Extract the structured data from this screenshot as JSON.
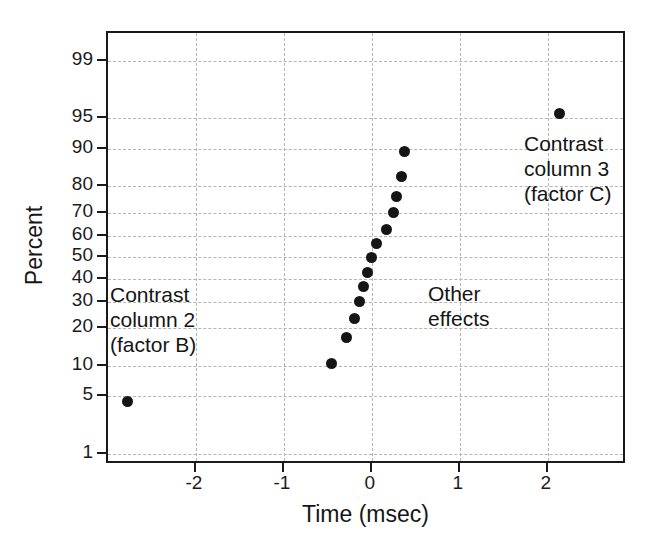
{
  "chart_data": {
    "type": "scatter",
    "title": "",
    "xlabel": "Time (msec)",
    "ylabel": "Percent",
    "xlim": [
      -3.0,
      2.9
    ],
    "ylim_percent": [
      0.7,
      99.6
    ],
    "grid": true,
    "legend": "none",
    "x_ticks": [
      "-2",
      "-1",
      "0",
      "1",
      "2"
    ],
    "x_tick_values": [
      -2,
      -1,
      0,
      1,
      2
    ],
    "y_ticks": [
      "99",
      "95",
      "90",
      "80",
      "70",
      "60",
      "50",
      "40",
      "30",
      "20",
      "10",
      "5",
      "1"
    ],
    "y_tick_values": [
      99,
      95,
      90,
      80,
      70,
      60,
      50,
      40,
      30,
      20,
      10,
      5,
      1
    ],
    "points": [
      {
        "x": -2.78,
        "y": 4.4,
        "label": "Contrast column 2 (factor B)"
      },
      {
        "x": -0.46,
        "y": 10.5,
        "label": ""
      },
      {
        "x": -0.29,
        "y": 17.0,
        "label": ""
      },
      {
        "x": -0.2,
        "y": 23.5,
        "label": ""
      },
      {
        "x": -0.14,
        "y": 30.0,
        "label": ""
      },
      {
        "x": -0.1,
        "y": 36.5,
        "label": ""
      },
      {
        "x": -0.05,
        "y": 43.0,
        "label": ""
      },
      {
        "x": 0.0,
        "y": 50.0,
        "label": ""
      },
      {
        "x": 0.05,
        "y": 56.5,
        "label": ""
      },
      {
        "x": 0.16,
        "y": 63.0,
        "label": ""
      },
      {
        "x": 0.24,
        "y": 70.0,
        "label": ""
      },
      {
        "x": 0.28,
        "y": 76.5,
        "label": ""
      },
      {
        "x": 0.34,
        "y": 83.0,
        "label": ""
      },
      {
        "x": 0.37,
        "y": 89.5,
        "label": ""
      },
      {
        "x": 2.13,
        "y": 95.6,
        "label": "Contrast column 3 (factor C)"
      }
    ],
    "annotations": [
      {
        "name": "annotation-left",
        "text": "Contrast\ncolumn 2\n(factor B)"
      },
      {
        "name": "annotation-center",
        "text": "Other\neffects"
      },
      {
        "name": "annotation-right",
        "text": "Contrast\ncolumn 3\n(factor C)"
      }
    ],
    "colors": {
      "marker": "#151515",
      "axis": "#1a1a1a",
      "grid": "#b4b4b4",
      "background": "#ffffff",
      "text": "#151515"
    }
  }
}
